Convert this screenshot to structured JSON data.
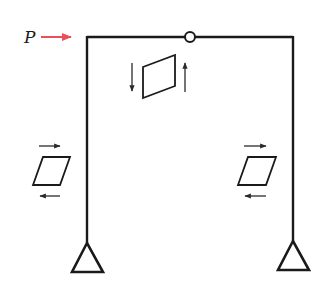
{
  "diagram": {
    "type": "portal-frame-shear-deformation",
    "load": {
      "label": "P",
      "direction": "right",
      "color": "#e8505b"
    },
    "frame": {
      "members": [
        "left-column",
        "beam",
        "right-column"
      ],
      "hinge": "internal hinge at top beam",
      "supports": [
        "left-pinned-support",
        "right-pinned-support"
      ]
    },
    "shear_elements": [
      {
        "location": "beam",
        "arrows": [
          "down-left",
          "up-right"
        ]
      },
      {
        "location": "left-column",
        "arrows": [
          "right-top",
          "left-bottom"
        ]
      },
      {
        "location": "right-column",
        "arrows": [
          "right-top",
          "left-bottom"
        ]
      }
    ],
    "colors": {
      "line": "#1a1a1a",
      "arrow": "#2a2a2a",
      "load": "#e8505b"
    }
  }
}
